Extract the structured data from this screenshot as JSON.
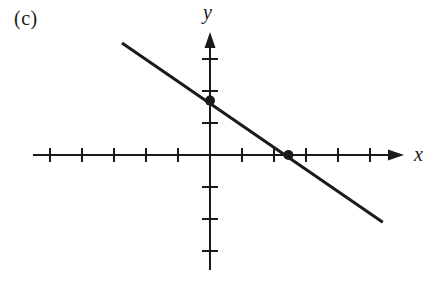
{
  "figure": {
    "panel_label": "(c)",
    "background_color": "#ffffff",
    "ink_color": "#1a1a1a"
  },
  "axes": {
    "x_label": "x",
    "y_label": "y",
    "origin_px": {
      "x": 210,
      "y": 155
    },
    "unit_px": 32,
    "x_axis_start_px": 33,
    "x_axis_arrow_tip_px": 404,
    "y_axis_start_px": 270,
    "y_axis_arrow_tip_px": 32,
    "x_ticks_units": [
      -5,
      -4,
      -3,
      -2,
      -1,
      1,
      2,
      3,
      4,
      5
    ],
    "y_ticks_units": [
      -3,
      -2,
      -1,
      1,
      2,
      3
    ],
    "tick_half_length_px": 7,
    "show_tick_labels": false,
    "show_grid": false
  },
  "chart_data": {
    "type": "line",
    "title": "(c)",
    "xlabel": "x",
    "ylabel": "y",
    "xlim": [
      -5.5,
      6.1
    ],
    "ylim": [
      -3.9,
      3.8
    ],
    "grid": false,
    "legend": null,
    "series": [
      {
        "name": "line",
        "kind": "linear",
        "slope": -0.67,
        "intercept": 1.7,
        "equation": "y = -2/3 x + 5/3",
        "x": [
          -2.75,
          5.4
        ],
        "y": [
          3.5,
          -2.1
        ],
        "line_width_px": 3,
        "color": "#1a1a1a"
      }
    ],
    "marked_points": [
      {
        "label": "y-intercept",
        "x": 0,
        "y": 1.7,
        "px": {
          "x": 210,
          "y": 100
        }
      },
      {
        "label": "x-intercept",
        "x": 2.45,
        "y": 0,
        "px": {
          "x": 288,
          "y": 155
        }
      }
    ]
  }
}
